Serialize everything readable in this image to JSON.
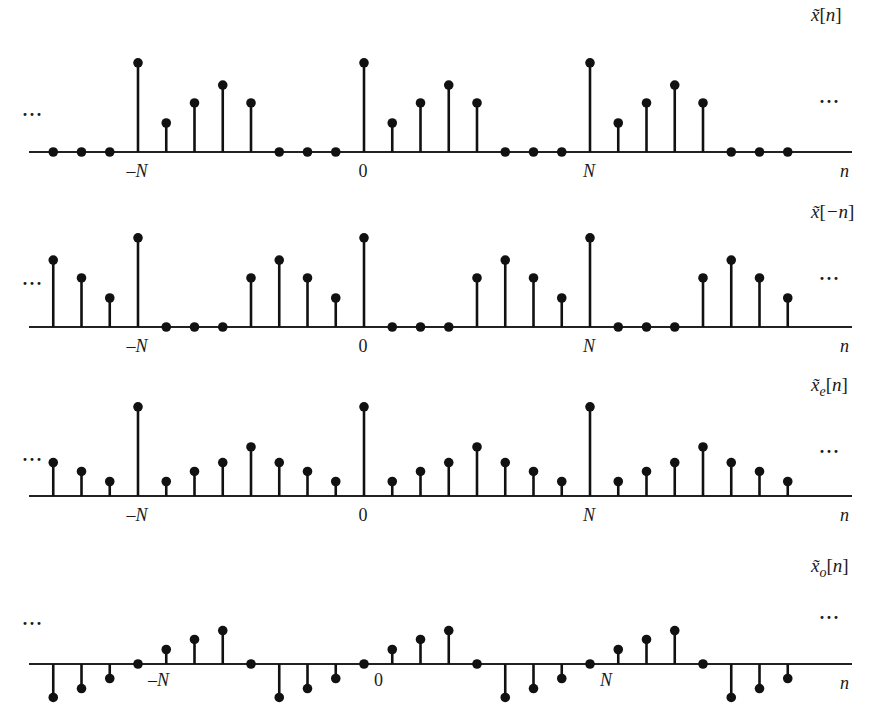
{
  "chart_data": [
    {
      "type": "stem",
      "title": "x̃[n]",
      "label_main": "x̃",
      "label_sub": "",
      "label_arg": "[n]",
      "xlabel": "n",
      "period_N": 8,
      "n_range": [
        -11,
        15
      ],
      "period_values": [
        4,
        1.3,
        2.2,
        3,
        2.2,
        0,
        0,
        0
      ],
      "tick_labels": [
        {
          "n": -8,
          "text": "–N"
        },
        {
          "n": 0,
          "text": "0"
        },
        {
          "n": 8,
          "text": "N"
        }
      ],
      "ellipsis": "···",
      "baseline_y": 152,
      "label_y": 21,
      "ellipsis_left_y": 121,
      "ellipsis_right_y": 108
    },
    {
      "type": "stem",
      "title": "x̃[−n]",
      "label_main": "x̃",
      "label_sub": "",
      "label_arg": "[−n]",
      "xlabel": "n",
      "period_N": 8,
      "n_range": [
        -11,
        15
      ],
      "period_values": [
        4,
        0,
        0,
        0,
        2.2,
        3,
        2.2,
        1.3
      ],
      "tick_labels": [
        {
          "n": -8,
          "text": "–N"
        },
        {
          "n": 0,
          "text": "0"
        },
        {
          "n": 8,
          "text": "N"
        }
      ],
      "ellipsis": "···",
      "baseline_y": 327,
      "label_y": 218,
      "ellipsis_left_y": 290,
      "ellipsis_right_y": 285
    },
    {
      "type": "stem",
      "title": "x̃e[n]",
      "label_main": "x̃",
      "label_sub": "e",
      "label_arg": "[n]",
      "xlabel": "n",
      "period_N": 8,
      "n_range": [
        -11,
        15
      ],
      "period_values": [
        4,
        0.65,
        1.1,
        1.5,
        2.2,
        1.5,
        1.1,
        0.65
      ],
      "tick_labels": [
        {
          "n": -8,
          "text": "–N"
        },
        {
          "n": 0,
          "text": "0"
        },
        {
          "n": 8,
          "text": "N"
        }
      ],
      "ellipsis": "···",
      "baseline_y": 496,
      "label_y": 391,
      "ellipsis_left_y": 466,
      "ellipsis_right_y": 458
    },
    {
      "type": "stem",
      "title": "x̃o[n]",
      "label_main": "x̃",
      "label_sub": "o",
      "label_arg": "[n]",
      "xlabel": "n",
      "period_N": 8,
      "n_range": [
        -11,
        15
      ],
      "period_values": [
        0,
        0.65,
        1.1,
        1.5,
        0,
        -1.5,
        -1.1,
        -0.65
      ],
      "tick_labels": [
        {
          "n": -8,
          "text": "–N"
        },
        {
          "n": 0,
          "text": "0"
        },
        {
          "n": 8,
          "text": "N"
        }
      ],
      "ellipsis": "···",
      "baseline_y": 664,
      "label_y": 572,
      "ellipsis_left_y": 630,
      "ellipsis_right_y": 624
    }
  ],
  "layout": {
    "x_at_n0": 364,
    "px_per_sample": 28.25,
    "px_per_unit": 22.3,
    "axis_x_start": 29,
    "axis_x_end": 852,
    "dot_radius": 4.8,
    "label_x": 811,
    "n_label_x": 840
  }
}
